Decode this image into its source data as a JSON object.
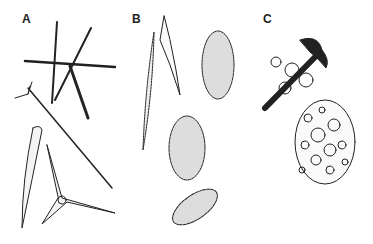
{
  "figure": {
    "panels": [
      {
        "label": "A",
        "items": [
          "hexactine",
          "monaxon-with-head",
          "tapered-tylote",
          "triradiate"
        ]
      },
      {
        "label": "B",
        "items": [
          "warty-spindle",
          "spiny-rod",
          "tuberculate-club-1",
          "tuberculate-club-2",
          "tuberculate-rod"
        ]
      },
      {
        "label": "C",
        "items": [
          "anchor",
          "perforated-plate"
        ]
      }
    ],
    "colors": {
      "ink": "#222222",
      "background": "#ffffff"
    }
  }
}
